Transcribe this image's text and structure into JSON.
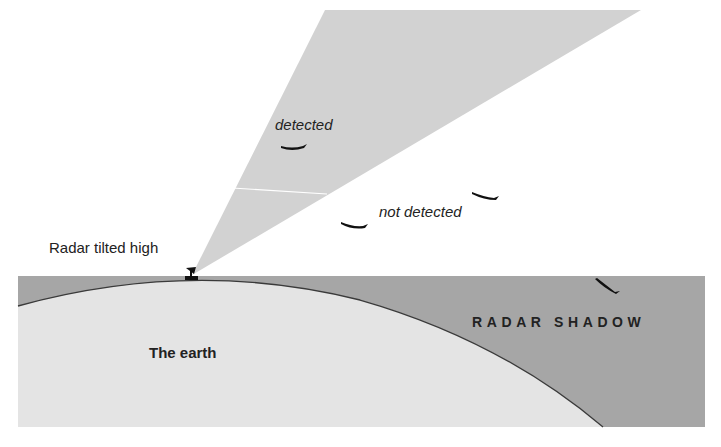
{
  "diagram": {
    "labels": {
      "detected": "detected",
      "not_detected": "not detected",
      "radar": "Radar tilted high",
      "earth": "The earth",
      "shadow": "RADAR SHADOW"
    },
    "elements": {
      "beam": "radar beam (light gray wedge)",
      "shadow_region": "radar shadow (dark gray band above earth curve)",
      "earth": "earth surface (curved light gray area)",
      "radar_dish": "radar antenna on earth surface",
      "aircraft": [
        {
          "id": "aircraft-1",
          "status": "detected",
          "location": "inside beam"
        },
        {
          "id": "aircraft-2",
          "status": "not detected",
          "location": "below beam"
        },
        {
          "id": "aircraft-3",
          "status": "not detected",
          "location": "below beam"
        },
        {
          "id": "aircraft-4",
          "status": "not detected",
          "location": "in radar shadow"
        }
      ]
    },
    "colors": {
      "beam": "#d2d2d2",
      "shadow": "#a6a6a6",
      "earth": "#e4e4e4",
      "horizon_line": "#3a3a3a",
      "aircraft": "#111111",
      "text": "#222222"
    }
  }
}
